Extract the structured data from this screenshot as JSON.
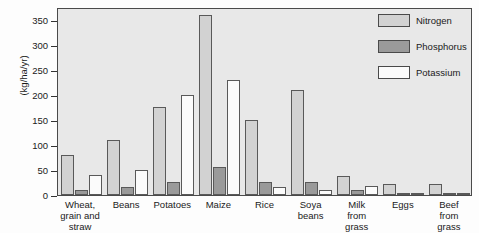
{
  "chart_data": {
    "type": "bar",
    "title": "",
    "subtitle": "",
    "xlabel": "",
    "ylabel": "(kg/ha/yr)",
    "ylim": [
      0,
      375
    ],
    "yticks": [
      0,
      50,
      100,
      150,
      200,
      250,
      300,
      350
    ],
    "ytick_labels": [
      "0",
      "50",
      "100",
      "150",
      "200",
      "250",
      "300",
      "350"
    ],
    "grid": false,
    "legend_position": "top-right",
    "categories": [
      "Wheat, grain and straw",
      "Beans",
      "Potatoes",
      "Maize",
      "Rice",
      "Soya beans",
      "Milk from grass",
      "Eggs",
      "Beef from grass"
    ],
    "category_label_lines": [
      [
        "Wheat,",
        "grain and",
        "straw"
      ],
      [
        "Beans"
      ],
      [
        "Potatoes"
      ],
      [
        "Maize"
      ],
      [
        "Rice"
      ],
      [
        "Soya",
        "beans"
      ],
      [
        "Milk",
        "from",
        "grass"
      ],
      [
        "Eggs"
      ],
      [
        "Beef",
        "from",
        "grass"
      ]
    ],
    "series": [
      {
        "name": "Nitrogen",
        "color": "#d2d2d2",
        "values": [
          80,
          110,
          175,
          360,
          150,
          210,
          37,
          22,
          22
        ]
      },
      {
        "name": "Phosphorus",
        "color": "#9a9a9a",
        "values": [
          10,
          15,
          25,
          55,
          25,
          25,
          10,
          4,
          3
        ]
      },
      {
        "name": "Potassium",
        "color": "#fbfbfb",
        "values": [
          40,
          50,
          200,
          230,
          15,
          10,
          17,
          2,
          5
        ]
      }
    ]
  },
  "legend": {
    "items": [
      {
        "label": "Nitrogen",
        "swatch": "nitrogen"
      },
      {
        "label": "Phosphorus",
        "swatch": "phosphorus"
      },
      {
        "label": "Potassium",
        "swatch": "potassium"
      }
    ]
  },
  "colors": {
    "nitrogen": "#d2d2d2",
    "phosphorus": "#9a9a9a",
    "potassium": "#fbfbfb",
    "plot_background": "#e8e8e8",
    "axis": "#4a4a4a"
  }
}
